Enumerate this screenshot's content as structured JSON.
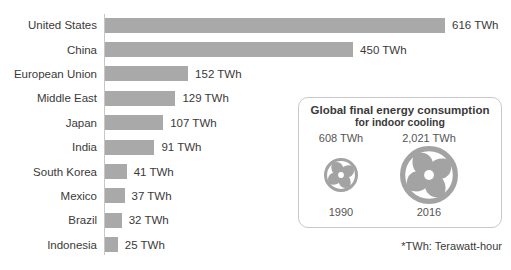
{
  "chart_data": {
    "type": "bar",
    "orientation": "horizontal",
    "title": "",
    "xlabel": "",
    "ylabel": "",
    "unit": "TWh",
    "xlim": [
      0,
      650
    ],
    "grid": false,
    "categories": [
      "United States",
      "China",
      "European Union",
      "Middle East",
      "Japan",
      "India",
      "South Korea",
      "Mexico",
      "Brazil",
      "Indonesia"
    ],
    "values": [
      616,
      450,
      152,
      129,
      107,
      91,
      41,
      37,
      32,
      25
    ],
    "value_labels": [
      "616 TWh",
      "450 TWh",
      "152 TWh",
      "129 TWh",
      "107 TWh",
      "91 TWh",
      "41 TWh",
      "37 TWh",
      "32 TWh",
      "25 TWh"
    ]
  },
  "inset": {
    "title": "Global final energy consumption",
    "subtitle": "for indoor cooling",
    "items": [
      {
        "value_label": "608 TWh",
        "year": "1990",
        "icon": "fan-icon",
        "size": "small"
      },
      {
        "value_label": "2,021 TWh",
        "year": "2016",
        "icon": "fan-icon",
        "size": "large"
      }
    ]
  },
  "footnote": "*TWh: Terawatt-hour",
  "colors": {
    "bar": "#a9a9a9",
    "fan": "#a3a3a3",
    "axis": "#c7c7c7",
    "border": "#c9c9c9",
    "text": "#3a3a3a",
    "muted": "#555555"
  }
}
